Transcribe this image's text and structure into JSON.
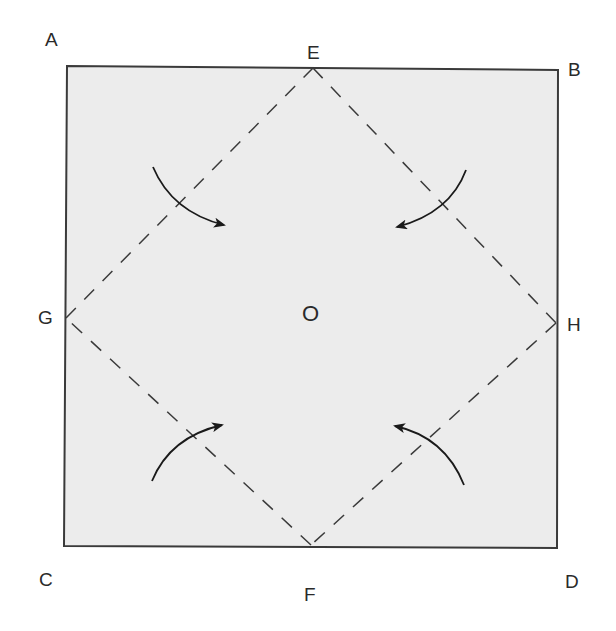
{
  "diagram": {
    "colors": {
      "paper": "#ececec",
      "outline": "#3a3a3a",
      "dash": "#3a3a3a",
      "arrow": "#1a1a1a",
      "label": "#2a2a2a"
    },
    "labels": {
      "A": "A",
      "B": "B",
      "C": "C",
      "D": "D",
      "E": "E",
      "F": "F",
      "G": "G",
      "H": "H",
      "O": "O"
    },
    "square": {
      "A": [
        67,
        66
      ],
      "B": [
        558,
        70
      ],
      "D": [
        557,
        548
      ],
      "C": [
        64,
        546
      ]
    },
    "fold_lines": [
      {
        "from": "E",
        "to": "H",
        "style": "dashed"
      },
      {
        "from": "H",
        "to": "F",
        "style": "dashed"
      },
      {
        "from": "F",
        "to": "G",
        "style": "dashed"
      },
      {
        "from": "G",
        "to": "E",
        "style": "dashed"
      }
    ],
    "arrows": [
      {
        "corner": "A",
        "direction": "fold-inward"
      },
      {
        "corner": "B",
        "direction": "fold-inward"
      },
      {
        "corner": "C",
        "direction": "fold-inward"
      },
      {
        "corner": "D",
        "direction": "fold-inward"
      }
    ]
  }
}
